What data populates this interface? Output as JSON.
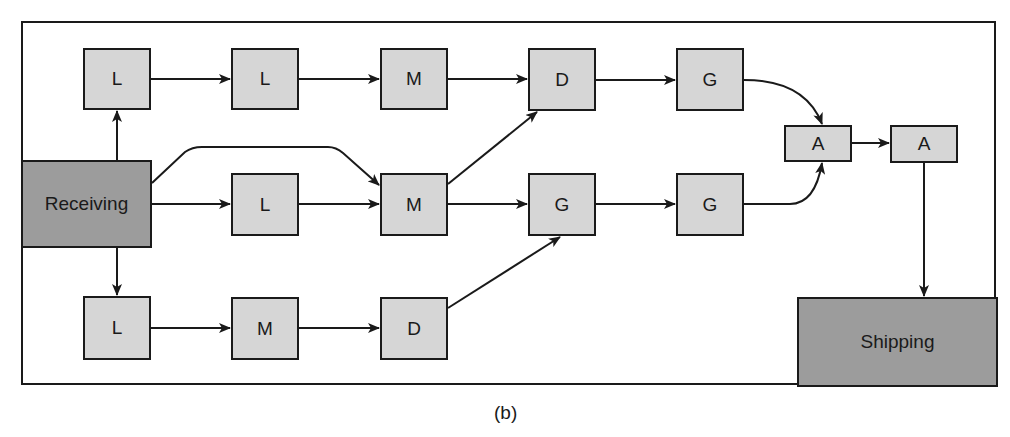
{
  "caption": "(b)",
  "colors": {
    "stroke": "#1a1a1a",
    "station_fill": "#d6d6d6",
    "dock_fill": "#9c9c9c",
    "background": "#ffffff"
  },
  "nodes": {
    "receiving": {
      "label": "Receiving",
      "x": 21,
      "y": 160,
      "w": 131,
      "h": 88
    },
    "shipping": {
      "label": "Shipping",
      "x": 797,
      "y": 297,
      "w": 199,
      "h": 90
    },
    "top_l1": {
      "label": "L",
      "x": 83,
      "y": 48,
      "w": 68,
      "h": 62
    },
    "top_l2": {
      "label": "L",
      "x": 231,
      "y": 48,
      "w": 68,
      "h": 62
    },
    "top_m": {
      "label": "M",
      "x": 380,
      "y": 48,
      "w": 68,
      "h": 62
    },
    "top_d": {
      "label": "D",
      "x": 528,
      "y": 48,
      "w": 68,
      "h": 63
    },
    "top_g": {
      "label": "G",
      "x": 676,
      "y": 48,
      "w": 68,
      "h": 63
    },
    "mid_l": {
      "label": "L",
      "x": 231,
      "y": 173,
      "w": 68,
      "h": 63
    },
    "mid_m": {
      "label": "M",
      "x": 380,
      "y": 173,
      "w": 68,
      "h": 63
    },
    "mid_g1": {
      "label": "G",
      "x": 528,
      "y": 173,
      "w": 68,
      "h": 63
    },
    "mid_g2": {
      "label": "G",
      "x": 676,
      "y": 173,
      "w": 68,
      "h": 63
    },
    "bot_l": {
      "label": "L",
      "x": 83,
      "y": 296,
      "w": 68,
      "h": 64
    },
    "bot_m": {
      "label": "M",
      "x": 231,
      "y": 297,
      "w": 68,
      "h": 63
    },
    "bot_d": {
      "label": "D",
      "x": 380,
      "y": 297,
      "w": 68,
      "h": 63
    },
    "asm_a1": {
      "label": "A",
      "x": 784,
      "y": 125,
      "w": 68,
      "h": 37
    },
    "asm_a2": {
      "label": "A",
      "x": 890,
      "y": 125,
      "w": 68,
      "h": 38
    }
  },
  "edges": [
    {
      "from": "Receiving",
      "to": "L (top)"
    },
    {
      "from": "Receiving",
      "to": "L (bottom)"
    },
    {
      "from": "Receiving",
      "to": "L (middle)"
    },
    {
      "from": "Receiving",
      "to": "M (middle)",
      "note": "bypass curve"
    },
    {
      "from": "L (top)",
      "to": "L (top 2)"
    },
    {
      "from": "L (top 2)",
      "to": "M (top)"
    },
    {
      "from": "M (top)",
      "to": "D (top)"
    },
    {
      "from": "D (top)",
      "to": "G (top)"
    },
    {
      "from": "G (top)",
      "to": "A (1)"
    },
    {
      "from": "L (middle)",
      "to": "M (middle)"
    },
    {
      "from": "M (middle)",
      "to": "D (top)"
    },
    {
      "from": "M (middle)",
      "to": "G (middle 1)"
    },
    {
      "from": "G (middle 1)",
      "to": "G (middle 2)"
    },
    {
      "from": "G (middle 2)",
      "to": "A (1)"
    },
    {
      "from": "L (bottom)",
      "to": "M (bottom)"
    },
    {
      "from": "M (bottom)",
      "to": "D (bottom)"
    },
    {
      "from": "D (bottom)",
      "to": "G (middle 1)"
    },
    {
      "from": "A (1)",
      "to": "A (2)"
    },
    {
      "from": "A (2)",
      "to": "Shipping"
    }
  ]
}
